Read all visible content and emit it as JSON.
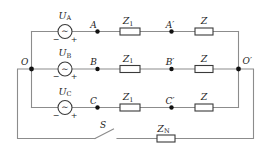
{
  "circuit": {
    "description": "Three-phase AC circuit with per-phase line impedance Z1, load impedance Z, and neutral wire containing switch S and impedance ZN",
    "colors": {
      "background": "#ffffff",
      "wire": "#8c8c8c",
      "component_stroke": "#3a3a3a",
      "text": "#1c1c1c",
      "node": "#111111"
    },
    "terminals": {
      "left": "O",
      "right": "O′"
    },
    "phases": [
      {
        "name": "phase-a",
        "source": {
          "label": "U",
          "sub": "A",
          "symbol": "∼",
          "minus": "−",
          "plus": "+"
        },
        "node_start": "A",
        "z1": {
          "label": "Z",
          "sub": "1"
        },
        "node_mid": "A′",
        "z2": {
          "label": "Z"
        }
      },
      {
        "name": "phase-b",
        "source": {
          "label": "U",
          "sub": "B",
          "symbol": "∼",
          "minus": "−",
          "plus": "+"
        },
        "node_start": "B",
        "z1": {
          "label": "Z",
          "sub": "1"
        },
        "node_mid": "B′",
        "z2": {
          "label": "Z"
        }
      },
      {
        "name": "phase-c",
        "source": {
          "label": "U",
          "sub": "C",
          "symbol": "∼",
          "minus": "−",
          "plus": "+"
        },
        "node_start": "C",
        "z1": {
          "label": "Z",
          "sub": "1"
        },
        "node_mid": "C′",
        "z2": {
          "label": "Z"
        }
      }
    ],
    "neutral": {
      "switch_label": "S",
      "impedance": {
        "label": "Z",
        "sub": "N"
      }
    }
  }
}
